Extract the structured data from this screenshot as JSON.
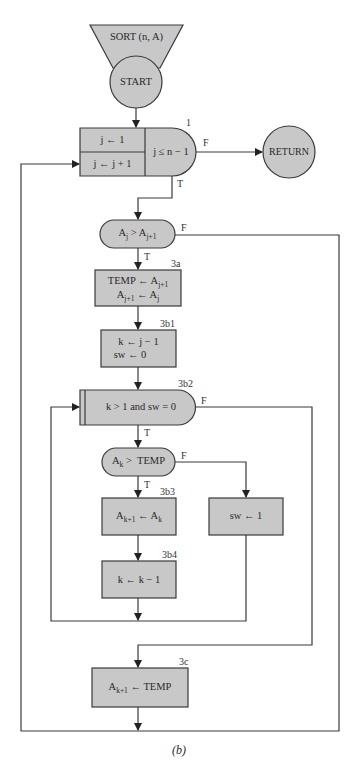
{
  "diagram": {
    "caption": "(b)",
    "colors": {
      "fill": "#c8c8c8",
      "stroke": "#3a3a3a",
      "background": "#ffffff"
    },
    "entry": {
      "label": "SORT (n, A)"
    },
    "start": {
      "label": "START"
    },
    "loop_1": {
      "id": "1",
      "init": "j ← 1",
      "increment": "j ← j + 1",
      "condition": "j ≤ n − 1",
      "true_label": "T",
      "false_label": "F"
    },
    "return": {
      "label": "RETURN"
    },
    "decision_aj": {
      "text_a": "A",
      "sub_a": "j",
      "op": " > ",
      "text_b": "A",
      "sub_b": "j+1",
      "true_label": "T",
      "false_label": "F"
    },
    "step_3a": {
      "id": "3a",
      "line1_lhs": "TEMP ← A",
      "line1_sub": "j+1",
      "line2_lhs": "A",
      "line2_sub": "j+1",
      "line2_rhs": " ← A",
      "line2_rhs_sub": "j"
    },
    "step_3b1": {
      "id": "3b1",
      "line1": "k ← j − 1",
      "line2": "sw ← 0"
    },
    "loop_3b2": {
      "id": "3b2",
      "condition": "k > 1 and sw = 0",
      "true_label": "T",
      "false_label": "F"
    },
    "decision_ak": {
      "text_a": "A",
      "sub_a": "k",
      "rhs": " >  TEMP",
      "true_label": "T",
      "false_label": "F"
    },
    "step_3b3": {
      "id": "3b3",
      "lhs": "A",
      "lhs_sub": "k+1",
      "mid": " ← A",
      "rhs_sub": "k"
    },
    "step_sw": {
      "text": "sw ← 1"
    },
    "step_3b4": {
      "id": "3b4",
      "text": "k ← k − 1"
    },
    "step_3c": {
      "id": "3c",
      "lhs": "A",
      "lhs_sub": "k+1",
      "rhs": " ← TEMP"
    }
  }
}
